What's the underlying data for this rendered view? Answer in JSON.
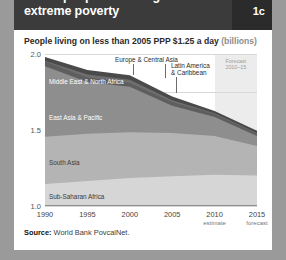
{
  "header": {
    "title": "Fewer people are living in extreme poverty",
    "badge": "1c"
  },
  "subtitle": {
    "text": "People living on less than 2005 PPP $1.25 a day",
    "unit": "(billions)"
  },
  "source": {
    "label": "Source:",
    "text": "World Bank PovcalNet."
  },
  "forecast": {
    "line1": "Forecast",
    "line2": "2010–15",
    "start_year": 2010,
    "end_year": 2015
  },
  "colors": {
    "header_bg": "#3b3b3b",
    "badge_bg": "#2b2b2b",
    "card_bg": "#ffffff",
    "page_bg": "#9a9a9a",
    "forecast_band": "#ececec",
    "sub_saharan_africa": "#d6d6d6",
    "south_asia": "#b4b4b4",
    "east_asia_pacific": "#8e8e8e",
    "middle_east_north_africa": "#5e5e5e",
    "europe_central_asia": "#6e6e6e",
    "latin_america_caribbean": "#4a4a4a"
  },
  "chart_data": {
    "type": "area",
    "title": "Fewer people are living in extreme poverty",
    "subtitle": "People living on less than 2005 PPP $1.25 a day (billions)",
    "xlabel": "",
    "ylabel": "billions",
    "xlim": [
      1990,
      2015
    ],
    "ylim": [
      0.0,
      2.0
    ],
    "yticks": [
      "0.0",
      "0.5",
      "1.0",
      "1.5",
      "2.0"
    ],
    "ytick_values": [
      0.0,
      0.5,
      1.0,
      1.5,
      2.0
    ],
    "grid": true,
    "legend": "inline-labels",
    "stacked": true,
    "x": [
      1990,
      1995,
      2000,
      2005,
      2010,
      2015
    ],
    "xticks": [
      {
        "label": "1990",
        "sub": ""
      },
      {
        "label": "1995",
        "sub": ""
      },
      {
        "label": "2000",
        "sub": ""
      },
      {
        "label": "2005",
        "sub": ""
      },
      {
        "label": "2010",
        "sub": "estimate"
      },
      {
        "label": "2015",
        "sub": "forecast"
      }
    ],
    "series": [
      {
        "name": "Sub-Saharan Africa",
        "values": [
          0.29,
          0.33,
          0.37,
          0.39,
          0.41,
          0.4
        ]
      },
      {
        "name": "South Asia",
        "values": [
          0.62,
          0.62,
          0.6,
          0.57,
          0.51,
          0.39
        ]
      },
      {
        "name": "East Asia & Pacific",
        "values": [
          0.93,
          0.68,
          0.6,
          0.36,
          0.25,
          0.13
        ]
      },
      {
        "name": "Middle East & North Africa",
        "values": [
          0.06,
          0.06,
          0.05,
          0.05,
          0.04,
          0.03
        ]
      },
      {
        "name": "Europe & Central Asia",
        "values": [
          0.01,
          0.04,
          0.04,
          0.02,
          0.01,
          0.01
        ]
      },
      {
        "name": "Latin America & Caribbean",
        "values": [
          0.05,
          0.06,
          0.06,
          0.05,
          0.03,
          0.03
        ]
      }
    ],
    "totals": [
      1.96,
      1.79,
      1.72,
      1.44,
      1.25,
      0.99
    ],
    "annotations": [
      {
        "text": "Forecast 2010–15",
        "type": "band",
        "from": 2010,
        "to": 2015
      }
    ]
  },
  "series_labels": {
    "europe_central_asia": "Europe & Central Asia",
    "middle_east_north_africa": "Middle East & North Africa",
    "east_asia_pacific": "East Asia & Pacific",
    "south_asia": "South Asia",
    "sub_saharan_africa": "Sub-Saharan Africa",
    "latin_america_caribbean_l1": "Latin America",
    "latin_america_caribbean_l2": "& Caribbean"
  }
}
